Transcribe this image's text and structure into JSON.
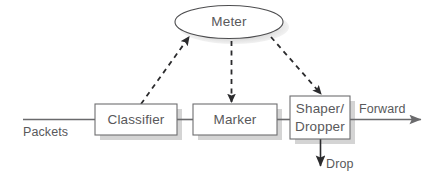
{
  "diagram": {
    "title": "",
    "colors": {
      "background": "#ffffff",
      "text": "#59595b",
      "box_stroke": "#6e6e70",
      "box_fill": "#ffffff",
      "shadow": "#d4d4d4",
      "flow_line": "#6a6a6c",
      "dashed_line": "#2b2b2d"
    },
    "nodes": [
      {
        "id": "meter",
        "label": "Meter",
        "shape": "ellipse"
      },
      {
        "id": "classifier",
        "label": "Classifier",
        "shape": "rect"
      },
      {
        "id": "marker",
        "label": "Marker",
        "shape": "rect"
      },
      {
        "id": "shaper_dropper",
        "label": "Shaper/ Dropper",
        "label_line1": "Shaper/",
        "label_line2": "Dropper",
        "shape": "rect"
      }
    ],
    "edge_labels": {
      "input": "Packets",
      "output": "Forward",
      "discard": "Drop"
    },
    "flow": [
      {
        "from": "input",
        "to": "classifier",
        "style": "solid"
      },
      {
        "from": "classifier",
        "to": "marker",
        "style": "solid"
      },
      {
        "from": "marker",
        "to": "shaper_dropper",
        "style": "solid"
      },
      {
        "from": "shaper_dropper",
        "to": "output",
        "style": "solid-arrow"
      },
      {
        "from": "shaper_dropper",
        "to": "discard",
        "style": "solid-arrow-down"
      },
      {
        "from": "classifier",
        "to": "meter",
        "style": "dashed-arrow"
      },
      {
        "from": "meter",
        "to": "marker",
        "style": "dashed-arrow"
      },
      {
        "from": "meter",
        "to": "shaper_dropper",
        "style": "dashed-arrow"
      }
    ]
  }
}
